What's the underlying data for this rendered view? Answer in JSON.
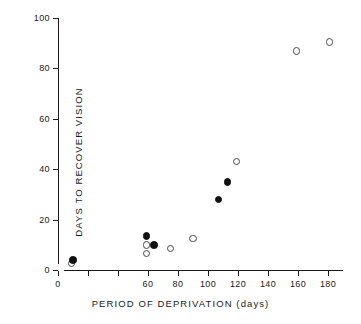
{
  "chart_data": {
    "type": "scatter",
    "title": "",
    "xlabel": "PERIOD OF DEPRIVATION  (days)",
    "ylabel": "DAYS TO  RECOVER VISION",
    "xlim": [
      0,
      190
    ],
    "ylim": [
      0,
      100
    ],
    "grid": false,
    "legend_position": "none",
    "x_ticks": [
      0,
      20,
      40,
      60,
      80,
      100,
      120,
      140,
      160,
      180
    ],
    "x_tick_labels": [
      "0",
      "",
      "",
      "60",
      "80",
      "100",
      "120",
      "140",
      "160",
      "180"
    ],
    "y_ticks": [
      0,
      20,
      40,
      60,
      80,
      100
    ],
    "y_tick_labels": [
      "0",
      "20",
      "40",
      "60",
      "80",
      "100"
    ],
    "series": [
      {
        "name": "filled",
        "marker": "filled-circle",
        "color": "#111111",
        "points": [
          {
            "x": 10,
            "y": 4
          },
          {
            "x": 59,
            "y": 13.5
          },
          {
            "x": 64,
            "y": 10
          },
          {
            "x": 107,
            "y": 28
          },
          {
            "x": 113,
            "y": 35
          }
        ]
      },
      {
        "name": "open",
        "marker": "open-circle",
        "color": "#4a4a4a",
        "points": [
          {
            "x": 9,
            "y": 2.5
          },
          {
            "x": 59,
            "y": 10
          },
          {
            "x": 59,
            "y": 6.5
          },
          {
            "x": 75,
            "y": 8.5
          },
          {
            "x": 90,
            "y": 12.5
          },
          {
            "x": 119,
            "y": 43
          },
          {
            "x": 159,
            "y": 87
          },
          {
            "x": 181,
            "y": 90.5
          }
        ]
      }
    ]
  }
}
